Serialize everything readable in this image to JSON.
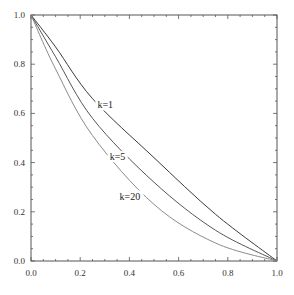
{
  "chart_data": {
    "type": "line",
    "title": "",
    "xlabel": "",
    "ylabel": "",
    "xlim": [
      0.0,
      1.0
    ],
    "ylim": [
      0.0,
      1.0
    ],
    "grid": false,
    "legend": "inline labels",
    "x_ticks": [
      "0.0",
      "0.2",
      "0.4",
      "0.6",
      "0.8",
      "1.0"
    ],
    "y_ticks": [
      "0.0",
      "0.2",
      "0.4",
      "0.6",
      "0.8",
      "1.0"
    ],
    "x": [
      0.0,
      0.1,
      0.25,
      0.5,
      0.75,
      1.0
    ],
    "series": [
      {
        "name": "k=1",
        "values": [
          1.0,
          0.87,
          0.66,
          0.42,
          0.19,
          0.0
        ],
        "color": "#3a3a3a",
        "label_pos": [
          0.27,
          0.62
        ]
      },
      {
        "name": "k=5",
        "values": [
          1.0,
          0.83,
          0.58,
          0.32,
          0.125,
          0.0
        ],
        "color": "#555555",
        "label_pos": [
          0.32,
          0.41
        ]
      },
      {
        "name": "k=20",
        "values": [
          1.0,
          0.78,
          0.51,
          0.23,
          0.073,
          0.0
        ],
        "color": "#8a8a8a",
        "label_pos": [
          0.36,
          0.25
        ]
      }
    ]
  }
}
